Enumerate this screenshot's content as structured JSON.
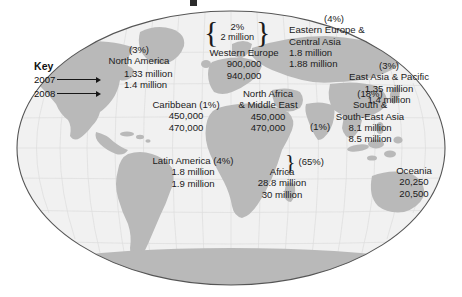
{
  "figure": {
    "type": "world-map-infographic",
    "projection": "oval",
    "key": {
      "title": "Key",
      "rows": [
        {
          "year": "2007"
        },
        {
          "year": "2008"
        }
      ]
    }
  },
  "regions": [
    {
      "id": "north-america",
      "name": "North America",
      "percent": "(3%)",
      "value_2007": "1.33 million",
      "value_2008": "1.4 million"
    },
    {
      "id": "western-europe",
      "name": "Western Europe",
      "brace_percent": "2%",
      "brace_value": "2 million",
      "value_2007": "900,000",
      "value_2008": "940,000"
    },
    {
      "id": "eastern-europe-central-asia",
      "name_line1": "Eastern Europe &",
      "name_line2": "Central Asia",
      "percent": "(4%)",
      "value_2007": "1.8 million",
      "value_2008": "1.88 million"
    },
    {
      "id": "east-asia-pacific",
      "name": "East Asia & Pacific",
      "percent": "(3%)",
      "value_2007": "1.35 million",
      "value_2008": "1.4 million"
    },
    {
      "id": "caribbean",
      "name": "Caribbean (1%)",
      "value_2007": "450,000",
      "value_2008": "470,000"
    },
    {
      "id": "north-africa-middle-east",
      "name_line1": "North Africa",
      "name_line2": "& Middle East",
      "percent": "(1%)",
      "value_2007": "450,000",
      "value_2008": "470,000"
    },
    {
      "id": "south-south-east-asia",
      "name_line1": "South &",
      "name_line2": "South-East Asia",
      "percent": "(18%)",
      "value_2007": "8.1 million",
      "value_2008": "8.5 million"
    },
    {
      "id": "latin-america",
      "name": "Latin America (4%)",
      "value_2007": "1.8 million",
      "value_2008": "1.9 million"
    },
    {
      "id": "africa",
      "name": "Africa",
      "percent": "(65%)",
      "value_2007": "28.8 million",
      "value_2008": "30 million"
    },
    {
      "id": "oceania",
      "name": "Oceania",
      "value_2007": "20,250",
      "value_2008": "20,500"
    }
  ],
  "colors": {
    "land": "#b9b9b9",
    "ocean": "#f1f1f1",
    "outline": "#555555",
    "graticule": "#dcdcdc",
    "text": "#1b1b1b"
  }
}
